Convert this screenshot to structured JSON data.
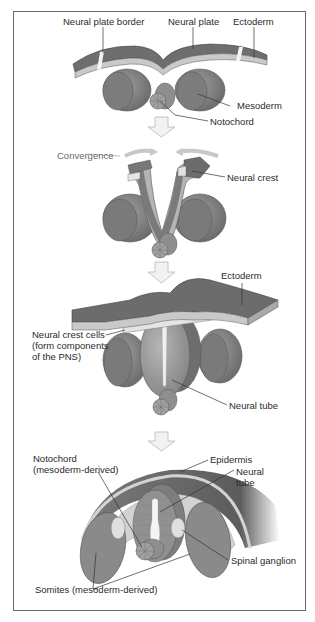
{
  "figure": {
    "stages": [
      {
        "id": "neural-plate",
        "labels": {
          "neural_plate_border": "Neural plate border",
          "neural_plate": "Neural plate",
          "ectoderm": "Ectoderm",
          "mesoderm": "Mesoderm",
          "notochord": "Notochord"
        }
      },
      {
        "id": "neural-folds",
        "labels": {
          "convergence": "Convergence",
          "neural_crest": "Neural crest"
        }
      },
      {
        "id": "neural-tube-closure",
        "labels": {
          "ectoderm": "Ectoderm",
          "neural_crest_cells": "Neural crest cells (form components of the PNS)",
          "neural_tube": "Neural tube"
        }
      },
      {
        "id": "differentiation",
        "labels": {
          "notochord": "Notochord (mesoderm-derived)",
          "epidermis": "Epidermis",
          "neural_tube": "Neural tube",
          "spinal_ganglion": "Spinal ganglion",
          "somites": "Somites (mesoderm-derived)"
        }
      }
    ],
    "colors": {
      "dark_tissue": "#6e6e6e",
      "mid_tissue": "#8c8c8c",
      "light_tissue": "#bdbdbd",
      "pale": "#dedede",
      "arrow_fill": "#f2f2f2",
      "arrow_stroke": "#b8b8b8",
      "frame": "#6a6a6a",
      "text": "#2a2a2a"
    }
  }
}
